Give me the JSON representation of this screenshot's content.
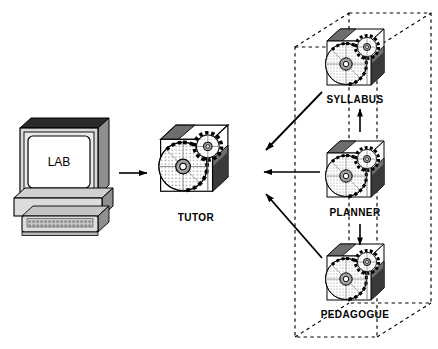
{
  "diagram": {
    "type": "architecture-block-diagram",
    "background_color": "#ffffff",
    "line_color": "#000000",
    "canvas": {
      "width": 438,
      "height": 349
    },
    "workstation": {
      "name": "lab-workstation",
      "screen_text": "LAB",
      "parts": [
        "monitor",
        "screen",
        "stand",
        "keyboard"
      ],
      "colors": {
        "bezel": "#d9d9d9",
        "screen": "#ffffff",
        "top_shade": "#2b2b2b",
        "side_shade": "#8f8f8f",
        "keyboard_body": "#cfcfcf",
        "key_fill": "#9a9a9a"
      }
    },
    "nodes": [
      {
        "id": "tutor",
        "label": "TUTOR",
        "x": 150,
        "y": 124,
        "size": 78,
        "in_container": false
      },
      {
        "id": "syllabus",
        "label": "SYLLABUS",
        "x": 318,
        "y": 28,
        "size": 66,
        "in_container": true
      },
      {
        "id": "planner",
        "label": "PLANNER",
        "x": 318,
        "y": 140,
        "size": 66,
        "in_container": true
      },
      {
        "id": "pedagogue",
        "label": "PEDAGOGUE",
        "x": 318,
        "y": 243,
        "size": 66,
        "in_container": true
      }
    ],
    "container": {
      "name": "agent-container",
      "style": "dashed-3d-box",
      "label": ""
    },
    "cube_style": {
      "front_face": "#ffffff",
      "top_face": "#ffffff",
      "top_shade": "#9a9a9a",
      "side_shade": "#6e6e6e",
      "side_dark": "#3c3c3c",
      "disc_fill": "#e3e3e3",
      "disc_stipple": "#9a9a9a",
      "hub_fill": "#a8a8a8",
      "gear_teeth": "#111111"
    },
    "arrows": [
      {
        "id": "lab-to-tutor",
        "from": "lab-workstation",
        "to": "tutor",
        "direction": "right",
        "style": "solid"
      },
      {
        "id": "syllabus-to-tutor",
        "from": "syllabus",
        "to": "tutor",
        "direction": "down-left",
        "style": "solid"
      },
      {
        "id": "planner-to-tutor",
        "from": "planner",
        "to": "tutor",
        "direction": "left",
        "style": "solid"
      },
      {
        "id": "pedagogue-to-tutor",
        "from": "pedagogue",
        "to": "tutor",
        "direction": "up-left",
        "style": "solid"
      },
      {
        "id": "planner-to-syllabus",
        "from": "planner",
        "to": "syllabus",
        "direction": "up",
        "style": "solid"
      },
      {
        "id": "planner-to-pedagogue",
        "from": "planner",
        "to": "pedagogue",
        "direction": "down",
        "style": "solid"
      }
    ]
  }
}
